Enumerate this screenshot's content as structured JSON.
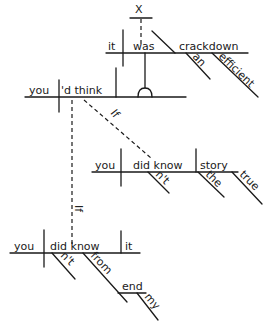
{
  "diagram": {
    "type": "reed-kellogg sentence diagram",
    "top_clause": {
      "placeholder": "X",
      "subject": "it",
      "verb": "was",
      "predicate_noun": "crackdown",
      "modifiers": [
        "an",
        "efficient"
      ]
    },
    "main_clause": {
      "subject": "you",
      "verb": "'d think",
      "connector": "If"
    },
    "if_clause": {
      "subject": "you",
      "verb": "did know",
      "negation": "n't",
      "object": "story",
      "modifiers": [
        "the",
        "true"
      ]
    },
    "second_if_clause": {
      "connector": "If",
      "subject": "you",
      "verb": "did know",
      "negation": "n't",
      "object": "it",
      "preposition": "from",
      "prep_object": "end",
      "prep_modifier": "my"
    }
  }
}
